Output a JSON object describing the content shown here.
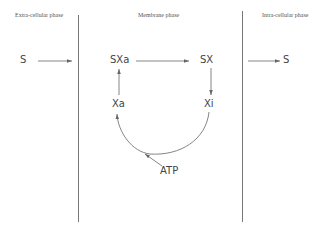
{
  "diagram": {
    "phases": {
      "extracellular": "Extra-cellular phase",
      "membrane": "Membrane phase",
      "intracellular": "Intra-cellular phase"
    },
    "nodes": {
      "s_outside": "S",
      "sxa": "SXa",
      "sx": "SX",
      "xa": "Xa",
      "xi": "Xi",
      "atp": "ATP",
      "s_inside": "S"
    },
    "edges": [
      {
        "from": "S (outside)",
        "to": "membrane"
      },
      {
        "from": "SXa",
        "to": "SX"
      },
      {
        "from": "SX",
        "to": "Xi"
      },
      {
        "from": "membrane",
        "to": "S (inside)"
      },
      {
        "from": "Xi",
        "to": "Xa",
        "via": "ATP"
      },
      {
        "from": "Xa",
        "to": "SXa"
      }
    ],
    "colors": {
      "line": "#666666",
      "text": "#444444"
    }
  }
}
